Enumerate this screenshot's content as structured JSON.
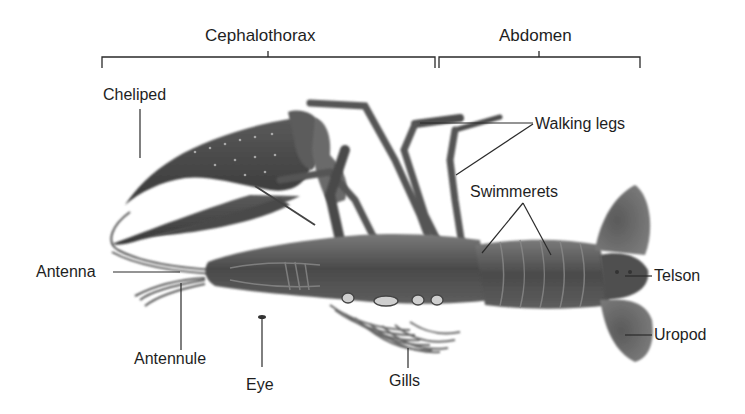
{
  "diagram": {
    "regions": [
      {
        "label": "Cephalothorax"
      },
      {
        "label": "Abdomen"
      }
    ],
    "labels": {
      "cheliped": "Cheliped",
      "walking_legs": "Walking legs",
      "swimmerets": "Swimmerets",
      "antenna": "Antenna",
      "antennule": "Antennule",
      "eye": "Eye",
      "gills": "Gills",
      "telson": "Telson",
      "uropod": "Uropod"
    },
    "colors": {
      "background": "#ffffff",
      "text": "#1e1e1e",
      "leader_lines": "#2a2a2a",
      "body_dark": "#3c3c3c",
      "body_mid": "#6a6a6a",
      "body_light": "#a8a8a8"
    }
  }
}
